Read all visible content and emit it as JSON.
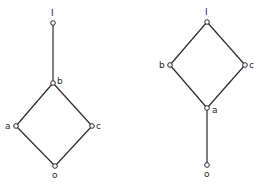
{
  "diagrams": [
    {
      "name": "left-lattice",
      "nodes": [
        {
          "id": "1",
          "label": "I",
          "x": 53,
          "y": 23,
          "lx": 51,
          "ly": 16
        },
        {
          "id": "b",
          "label": "b",
          "x": 53,
          "y": 83,
          "lx": 57,
          "ly": 84
        },
        {
          "id": "a",
          "label": "a",
          "x": 16,
          "y": 126,
          "lx": 5,
          "ly": 129
        },
        {
          "id": "c",
          "label": "c",
          "x": 92,
          "y": 126,
          "lx": 96,
          "ly": 129
        },
        {
          "id": "0",
          "label": "o",
          "x": 55,
          "y": 166,
          "lx": 52,
          "ly": 178
        }
      ],
      "edges": [
        [
          "1",
          "b"
        ],
        [
          "b",
          "a"
        ],
        [
          "b",
          "c"
        ],
        [
          "a",
          "0"
        ],
        [
          "c",
          "0"
        ]
      ]
    },
    {
      "name": "right-lattice",
      "nodes": [
        {
          "id": "1",
          "label": "I",
          "x": 207,
          "y": 22,
          "lx": 205,
          "ly": 15
        },
        {
          "id": "b",
          "label": "b",
          "x": 170,
          "y": 65,
          "lx": 159,
          "ly": 68
        },
        {
          "id": "c",
          "label": "c",
          "x": 245,
          "y": 65,
          "lx": 249,
          "ly": 68
        },
        {
          "id": "a",
          "label": "a",
          "x": 207,
          "y": 108,
          "lx": 212,
          "ly": 113
        },
        {
          "id": "0",
          "label": "o",
          "x": 207,
          "y": 165,
          "lx": 204,
          "ly": 177
        }
      ],
      "edges": [
        [
          "1",
          "b"
        ],
        [
          "1",
          "c"
        ],
        [
          "b",
          "a"
        ],
        [
          "c",
          "a"
        ],
        [
          "a",
          "0"
        ]
      ]
    }
  ],
  "colors": {
    "line": "#2a2a2a",
    "background": "#ffffff"
  }
}
